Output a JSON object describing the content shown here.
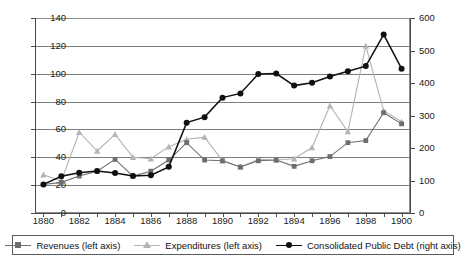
{
  "chart_data": {
    "type": "line",
    "title": "",
    "xlabel": "",
    "ylabel": "",
    "x": [
      1880,
      1881,
      1882,
      1883,
      1884,
      1885,
      1886,
      1887,
      1888,
      1889,
      1890,
      1891,
      1892,
      1893,
      1894,
      1895,
      1896,
      1897,
      1898,
      1899,
      1900
    ],
    "xtick_labels": [
      "1880",
      "",
      "1882",
      "",
      "1884",
      "",
      "1886",
      "",
      "1888",
      "",
      "1890",
      "",
      "1892",
      "",
      "1894",
      "",
      "1896",
      "",
      "1898",
      "",
      "1900"
    ],
    "xtick_labels_shown": [
      "1880",
      "1882",
      "1884",
      "1886",
      "1888",
      "1890",
      "1892",
      "1894",
      "1896",
      "1898",
      "1900"
    ],
    "left_axis": {
      "label": "",
      "ylim": [
        0,
        140
      ],
      "ticks": [
        0,
        20,
        40,
        60,
        80,
        100,
        120,
        140
      ],
      "tick_labels": [
        "0",
        "20",
        "40",
        "60",
        "80",
        "100",
        "120",
        "140"
      ]
    },
    "right_axis": {
      "label": "",
      "ylim": [
        0,
        600
      ],
      "ticks": [
        0,
        100,
        200,
        300,
        400,
        500,
        600
      ],
      "tick_labels": [
        "0",
        "100",
        "200",
        "300",
        "400",
        "500",
        "600"
      ]
    },
    "grid": true,
    "legend_position": "bottom",
    "series": [
      {
        "name": "Revenues (left axis)",
        "axis": "left",
        "color": "#6e6e6e",
        "marker": "square",
        "values": [
          20.5,
          22.0,
          26.5,
          30.0,
          38.5,
          26.5,
          30.0,
          38.0,
          50.5,
          38.0,
          37.5,
          33.0,
          37.5,
          38.0,
          33.5,
          37.5,
          40.5,
          50.5,
          52.0,
          72.0,
          64.0
        ]
      },
      {
        "name": "Expenditures (left axis)",
        "axis": "left",
        "color": "#b4b4b4",
        "marker": "triangle",
        "values": [
          27.5,
          23.0,
          58.0,
          44.5,
          56.5,
          40.0,
          39.0,
          47.5,
          53.0,
          54.5,
          37.5,
          33.0,
          38.5,
          38.0,
          39.0,
          47.0,
          77.0,
          58.5,
          120.0,
          73.5,
          65.5
        ]
      },
      {
        "name": "Consolidated Public Debt (right axis)",
        "axis": "right",
        "color": "#101010",
        "marker": "circle",
        "values": [
          88,
          113,
          124,
          129,
          123,
          114,
          116,
          142,
          278,
          295,
          355,
          368,
          428,
          429,
          392,
          401,
          420,
          436,
          452,
          549,
          444
        ]
      }
    ]
  },
  "legend": {
    "items": [
      {
        "label": "Revenues (left axis)"
      },
      {
        "label": "Expenditures (left axis)"
      },
      {
        "label": "Consolidated Public Debt (right axis)"
      }
    ]
  }
}
